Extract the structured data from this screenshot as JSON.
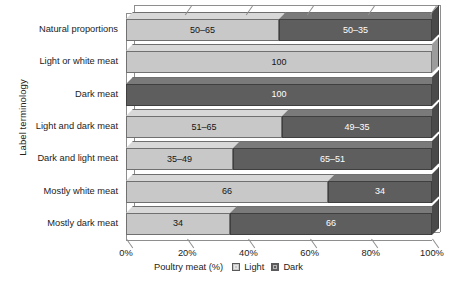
{
  "chart_data": {
    "type": "bar",
    "orientation": "horizontal",
    "stacked": true,
    "title": "",
    "xlabel": "Poultry meat (%)",
    "ylabel": "Label terminology",
    "xlim": [
      0,
      100
    ],
    "xticks": [
      "0%",
      "20%",
      "40%",
      "60%",
      "80%",
      "100%"
    ],
    "xtick_values": [
      0,
      20,
      40,
      60,
      80,
      100
    ],
    "grid": true,
    "legend_position": "bottom",
    "categories": [
      "Natural proportions",
      "Light or white meat",
      "Dark meat",
      "Light and dark meat",
      "Dark and light meat",
      "Mostly white meat",
      "Mostly dark meat"
    ],
    "series": [
      {
        "name": "Light",
        "color": "#c8c8c8",
        "values": [
          50,
          100,
          0,
          51,
          35,
          66,
          34
        ],
        "labels": [
          "50–65",
          "100",
          "",
          "51–65",
          "35–49",
          "66",
          "34"
        ]
      },
      {
        "name": "Dark",
        "color": "#5e5e5e",
        "values": [
          50,
          0,
          100,
          49,
          65,
          34,
          66
        ],
        "labels": [
          "50–35",
          "",
          "100",
          "49–35",
          "65–51",
          "34",
          "66"
        ]
      }
    ]
  },
  "legend": {
    "title": "Poultry meat (%)",
    "entries": [
      {
        "label": "Light",
        "swatch": "light-swatch-icon"
      },
      {
        "label": "Dark",
        "swatch": "dark-swatch-icon"
      }
    ]
  },
  "axes": {
    "y_title": "Label terminology",
    "x_title": "Poultry meat (%)"
  }
}
